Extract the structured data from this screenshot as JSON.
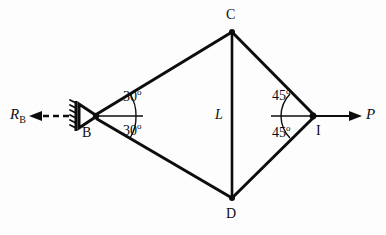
{
  "figure": {
    "type": "truss-free-body-diagram",
    "background_color": "#fdfdfd",
    "line_color": "#0d0d0d"
  },
  "nodes": [
    {
      "id": "B",
      "label": "B",
      "x": 95,
      "y": 116,
      "role": "pin-support"
    },
    {
      "id": "C",
      "label": "C",
      "x": 232,
      "y": 31,
      "role": "joint"
    },
    {
      "id": "D",
      "label": "D",
      "x": 232,
      "y": 199,
      "role": "joint"
    },
    {
      "id": "I",
      "label": "I",
      "x": 313,
      "y": 116,
      "role": "load-joint"
    }
  ],
  "members": [
    {
      "from": "B",
      "to": "C"
    },
    {
      "from": "B",
      "to": "D"
    },
    {
      "from": "C",
      "to": "D"
    },
    {
      "from": "C",
      "to": "I"
    },
    {
      "from": "D",
      "to": "I"
    }
  ],
  "angles": [
    {
      "at": "B",
      "position": "upper",
      "value": "30",
      "unit": "o",
      "text": "30"
    },
    {
      "at": "B",
      "position": "lower",
      "value": "30",
      "unit": "o",
      "text": "30"
    },
    {
      "at": "I",
      "position": "upper",
      "value": "45",
      "unit": "o",
      "text": "45"
    },
    {
      "at": "I",
      "position": "lower",
      "value": "45",
      "unit": "o",
      "text": "45"
    }
  ],
  "forces": [
    {
      "name": "reaction-at-b",
      "symbol": "R",
      "subscript": "B",
      "direction": "left",
      "line_style": "dashed"
    },
    {
      "name": "applied-load-p",
      "symbol": "P",
      "subscript": "",
      "direction": "right",
      "line_style": "solid"
    }
  ],
  "dimensions": [
    {
      "name": "vertical-member-length",
      "label": "L",
      "member": "CD"
    }
  ],
  "support": {
    "at": "B",
    "type": "pin",
    "hatching": true,
    "hatch_count": 6
  }
}
